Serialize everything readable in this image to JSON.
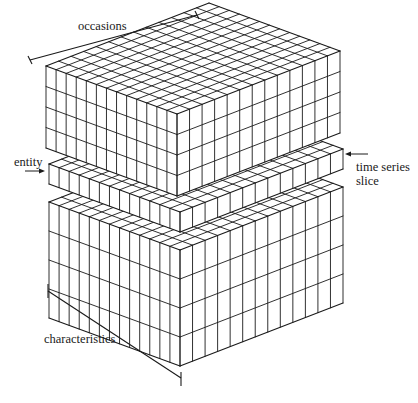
{
  "figure": {
    "line_color": "#1a1a1a",
    "background": "#ffffff"
  },
  "labels": {
    "occasions": "occasions",
    "entity": "entity",
    "time_series_line1": "time series",
    "time_series_line2": "slice",
    "characteristics": "characteristics"
  },
  "grid": {
    "occasions_cells": 13,
    "entity_cells": 13,
    "top_block_rows": 4,
    "slice_rows": 1,
    "bottom_block_rows": 4
  },
  "geometry": {
    "left_vec": [
      -131,
      -48
    ],
    "right_vec": [
      163,
      -63
    ],
    "top_block": {
      "front_top": [
        177,
        114
      ],
      "height": 82
    },
    "slice": {
      "front_top": [
        180,
        212
      ],
      "height": 20
    },
    "bottom_block": {
      "front_top": [
        180,
        250
      ],
      "height": 116
    }
  }
}
